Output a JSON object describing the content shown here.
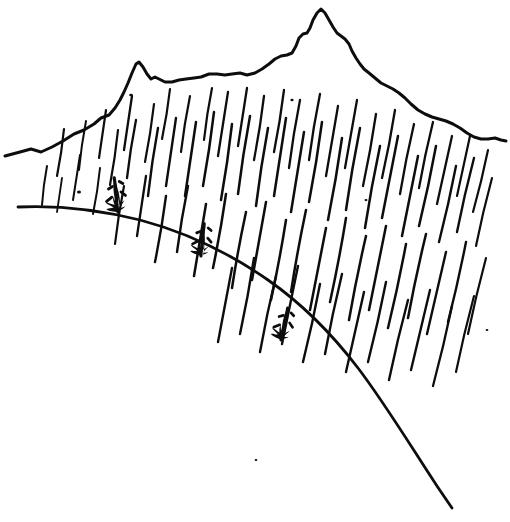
{
  "figure": {
    "kind": "line-drawing",
    "medium": "pen-and-ink",
    "title": "Rain falling on a mountain ridge above a sloping hillside",
    "background_color": "#ffffff",
    "ink_color": "#0d0d0d",
    "width": 510,
    "height": 522
  },
  "elements": {
    "ridge": {
      "name": "mountain-ridge-outline",
      "label": "Mountain ridge outline",
      "stroke_width": 3.0,
      "peaks": [
        {
          "label": "left secondary peak",
          "x": 138,
          "y": 62
        },
        {
          "label": "main summit",
          "x": 322,
          "y": 10
        }
      ],
      "saddle": {
        "label": "saddle between peaks",
        "x": 232,
        "y": 74
      },
      "left_end": {
        "x": 5,
        "y": 156
      },
      "right_end": {
        "x": 506,
        "y": 141
      },
      "path": "M5,156 L20,152 L31,149 L41,152 L52,147 L63,141 L74,134 L84,130 L94,124 L101,118 L109,115 L115,108 L120,100 L124,92 L128,83 L132,73 L136,64 L139,62 L143,67 L147,74 L151,79 L155,77 L159,79 L165,82 L172,82 L179,80 L186,79 L194,78 L201,77 L209,74 L217,74 L225,75 L232,74 L240,73 L247,75 L255,73 L262,69 L269,64 L275,59 L281,56 L287,55 L292,53 L296,46 L299,38 L303,34 L307,33 L310,28 L313,20 L317,13 L321,9 L325,13 L329,20 L333,27 L337,33 L341,36 L345,39 L349,44 L352,51 L356,58 L360,64 L364,69 L369,73 L375,78 L381,83 L387,86 L393,89 L399,93 L405,98 L411,104 L418,110 L425,114 L432,117 L439,119 L446,121 L453,124 L460,128 L467,133 L474,137 L481,139 L488,139 L495,138 L501,140 L506,141"
    },
    "slope": {
      "name": "hillside-slope-line",
      "label": "Hillside slope line",
      "stroke_width": 2.8,
      "start": {
        "x": 18,
        "y": 207
      },
      "end": {
        "x": 452,
        "y": 508
      },
      "path": "M18,207 C60,205 100,210 140,220 C185,232 228,252 268,280 C304,305 332,334 358,368 C384,402 412,448 437,486 C443,495 448,502 452,508"
    },
    "shrubs": [
      {
        "name": "shrub-upper-left",
        "label": "Shrub on upper slope",
        "anchor_x": 118,
        "anchor_y": 212,
        "height": 38,
        "lean_deg": -4
      },
      {
        "name": "shrub-middle",
        "label": "Shrub on middle slope",
        "anchor_x": 201,
        "anchor_y": 256,
        "height": 36,
        "lean_deg": 8
      },
      {
        "name": "shrub-lower-right",
        "label": "Shrub on lower slope",
        "anchor_x": 281,
        "anchor_y": 340,
        "height": 36,
        "lean_deg": 14
      }
    ],
    "rain": {
      "name": "rain-hatching",
      "label": "Rain strokes",
      "stroke_count": 78,
      "stroke_width": 2.2,
      "tilt_range_deg": [
        6,
        24
      ],
      "length_range_px": [
        26,
        118
      ],
      "region": {
        "x": 30,
        "y": 88,
        "width": 470,
        "height": 310
      },
      "strokes": [
        [
          47,
          166,
          42,
          205,
          2.0
        ],
        [
          80,
          155,
          73,
          200,
          2.0
        ],
        [
          64,
          129,
          57,
          176,
          2.2
        ],
        [
          86,
          121,
          79,
          170,
          2.0
        ],
        [
          106,
          110,
          99,
          158,
          2.2
        ],
        [
          118,
          130,
          110,
          185,
          2.2
        ],
        [
          136,
          120,
          127,
          178,
          2.3
        ],
        [
          132,
          96,
          124,
          150,
          2.3
        ],
        [
          154,
          104,
          145,
          162,
          2.2
        ],
        [
          158,
          128,
          148,
          196,
          2.4
        ],
        [
          176,
          118,
          166,
          186,
          2.4
        ],
        [
          170,
          89,
          162,
          139,
          2.2
        ],
        [
          190,
          96,
          181,
          152,
          2.2
        ],
        [
          196,
          122,
          185,
          196,
          2.5
        ],
        [
          214,
          112,
          203,
          186,
          2.5
        ],
        [
          212,
          88,
          204,
          140,
          2.2
        ],
        [
          228,
          92,
          218,
          156,
          2.3
        ],
        [
          232,
          124,
          221,
          200,
          2.5
        ],
        [
          250,
          116,
          238,
          194,
          2.5
        ],
        [
          247,
          88,
          238,
          146,
          2.3
        ],
        [
          264,
          96,
          254,
          160,
          2.3
        ],
        [
          268,
          128,
          256,
          206,
          2.5
        ],
        [
          286,
          118,
          274,
          196,
          2.5
        ],
        [
          284,
          90,
          274,
          152,
          2.3
        ],
        [
          300,
          100,
          289,
          168,
          2.3
        ],
        [
          304,
          132,
          291,
          212,
          2.5
        ],
        [
          322,
          122,
          309,
          202,
          2.5
        ],
        [
          320,
          94,
          309,
          160,
          2.3
        ],
        [
          338,
          106,
          326,
          176,
          2.3
        ],
        [
          342,
          138,
          328,
          220,
          2.5
        ],
        [
          360,
          128,
          346,
          210,
          2.5
        ],
        [
          357,
          100,
          345,
          168,
          2.3
        ],
        [
          376,
          114,
          363,
          186,
          2.3
        ],
        [
          380,
          146,
          365,
          228,
          2.5
        ],
        [
          398,
          136,
          382,
          218,
          2.5
        ],
        [
          395,
          110,
          382,
          178,
          2.3
        ],
        [
          414,
          124,
          400,
          194,
          2.3
        ],
        [
          418,
          156,
          402,
          236,
          2.5
        ],
        [
          436,
          146,
          419,
          226,
          2.5
        ],
        [
          433,
          122,
          419,
          188,
          2.3
        ],
        [
          452,
          136,
          437,
          204,
          2.3
        ],
        [
          456,
          166,
          439,
          242,
          2.4
        ],
        [
          474,
          158,
          457,
          232,
          2.4
        ],
        [
          470,
          136,
          457,
          196,
          2.2
        ],
        [
          488,
          150,
          473,
          212,
          2.2
        ],
        [
          492,
          178,
          476,
          246,
          2.2
        ],
        [
          62,
          178,
          57,
          212,
          1.8
        ],
        [
          100,
          168,
          93,
          214,
          2.0
        ],
        [
          124,
          186,
          115,
          244,
          2.2
        ],
        [
          146,
          176,
          137,
          236,
          2.3
        ],
        [
          166,
          196,
          155,
          262,
          2.4
        ],
        [
          188,
          186,
          177,
          252,
          2.4
        ],
        [
          206,
          204,
          194,
          276,
          2.5
        ],
        [
          226,
          194,
          213,
          268,
          2.5
        ],
        [
          246,
          212,
          232,
          288,
          2.5
        ],
        [
          266,
          202,
          252,
          280,
          2.5
        ],
        [
          286,
          220,
          271,
          300,
          2.5
        ],
        [
          306,
          210,
          291,
          292,
          2.5
        ],
        [
          326,
          228,
          310,
          310,
          2.5
        ],
        [
          346,
          218,
          330,
          302,
          2.5
        ],
        [
          366,
          236,
          349,
          320,
          2.5
        ],
        [
          386,
          226,
          369,
          310,
          2.5
        ],
        [
          406,
          244,
          388,
          328,
          2.5
        ],
        [
          426,
          234,
          408,
          318,
          2.5
        ],
        [
          446,
          252,
          427,
          334,
          2.4
        ],
        [
          466,
          242,
          448,
          322,
          2.4
        ],
        [
          486,
          258,
          468,
          334,
          2.2
        ],
        [
          232,
          268,
          218,
          342,
          2.4
        ],
        [
          254,
          258,
          240,
          334,
          2.4
        ],
        [
          276,
          276,
          260,
          352,
          2.4
        ],
        [
          298,
          266,
          282,
          344,
          2.4
        ],
        [
          320,
          284,
          303,
          362,
          2.4
        ],
        [
          342,
          274,
          325,
          354,
          2.4
        ],
        [
          364,
          292,
          346,
          372,
          2.4
        ],
        [
          386,
          282,
          368,
          362,
          2.4
        ],
        [
          408,
          300,
          389,
          380,
          2.4
        ],
        [
          430,
          290,
          411,
          370,
          2.4
        ],
        [
          452,
          306,
          433,
          386,
          2.3
        ],
        [
          474,
          296,
          456,
          372,
          2.2
        ]
      ],
      "speckles": [
        [
          79,
          192,
          2.0
        ],
        [
          131,
          95,
          1.8
        ],
        [
          292,
          100,
          1.6
        ],
        [
          366,
          200,
          1.5
        ],
        [
          487,
          330,
          1.4
        ],
        [
          256,
          460,
          1.4
        ]
      ]
    }
  }
}
